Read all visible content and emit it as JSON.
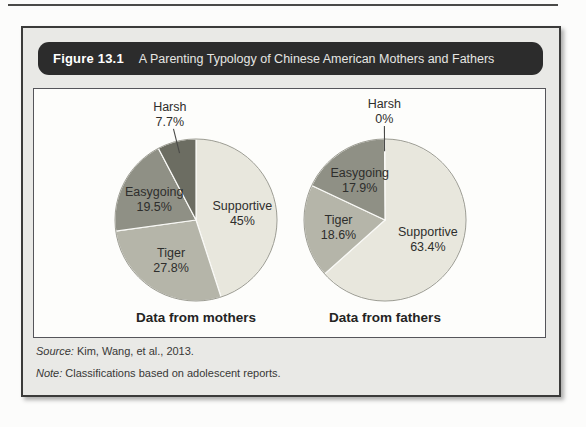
{
  "figure": {
    "label": "Figure 13.1",
    "title": "A Parenting Typology of Chinese American Mothers and Fathers"
  },
  "footnotes": {
    "source": {
      "prefix": "Source:",
      "text": "Kim, Wang, et al., 2013."
    },
    "note": {
      "prefix": "Note:",
      "text": "Classifications based on adolescent reports."
    }
  },
  "colors": {
    "banner_bg": "#2c2c2c",
    "banner_text": "#ffffff",
    "box_bg": "#e9e9e6",
    "panel_bg": "#fdfdfb",
    "label_text": "#2e2e2c",
    "slice_separator": "#fafaf7",
    "pie_rim": "#9b9b91",
    "leader_line": "#4a4a48"
  },
  "chart_data": [
    {
      "type": "pie",
      "title": "Data from mothers",
      "start_angle_deg": 0,
      "direction": "clockwise",
      "slices": [
        {
          "label": "Supportive",
          "value": 45,
          "display": "45%",
          "color": "#e8e7dd",
          "label_placement": "inside"
        },
        {
          "label": "Tiger",
          "value": 27.8,
          "display": "27.8%",
          "color": "#b5b5a9",
          "label_placement": "inside"
        },
        {
          "label": "Easygoing",
          "value": 19.5,
          "display": "19.5%",
          "color": "#8f9085",
          "label_placement": "inside"
        },
        {
          "label": "Harsh",
          "value": 7.7,
          "display": "7.7%",
          "color": "#6c6d62",
          "label_placement": "outside"
        }
      ]
    },
    {
      "type": "pie",
      "title": "Data from fathers",
      "start_angle_deg": 0,
      "direction": "clockwise",
      "slices": [
        {
          "label": "Supportive",
          "value": 63.4,
          "display": "63.4%",
          "color": "#e8e7dd",
          "label_placement": "inside"
        },
        {
          "label": "Tiger",
          "value": 18.6,
          "display": "18.6%",
          "color": "#b5b5a9",
          "label_placement": "inside"
        },
        {
          "label": "Easygoing",
          "value": 17.9,
          "display": "17.9%",
          "color": "#8f9085",
          "label_placement": "inside"
        },
        {
          "label": "Harsh",
          "value": 0,
          "display": "0%",
          "color": "#6c6d62",
          "label_placement": "outside"
        }
      ]
    }
  ]
}
